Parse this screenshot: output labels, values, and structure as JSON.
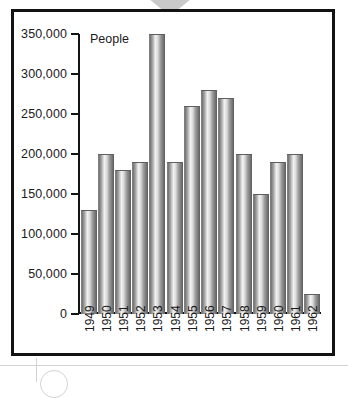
{
  "figure": {
    "axis_title": "People",
    "frame_color": "#131313",
    "bar_color": "#9d9d9d"
  },
  "chart_data": {
    "type": "bar",
    "title": "",
    "subtitle": "",
    "xlabel": "",
    "ylabel": "People",
    "ylim": [
      0,
      350000
    ],
    "grid": false,
    "legend": null,
    "categories": [
      "1949",
      "1950",
      "1951",
      "1952",
      "1953",
      "1954",
      "1955",
      "1956",
      "1957",
      "1958",
      "1959",
      "1960",
      "1961",
      "1962"
    ],
    "values": [
      130000,
      200000,
      180000,
      190000,
      350000,
      190000,
      260000,
      280000,
      270000,
      200000,
      150000,
      190000,
      200000,
      25000
    ],
    "ytick_labels": [
      "350,000",
      "300,000",
      "250,000",
      "200,000",
      "150,000",
      "100,000",
      "50,000",
      "0"
    ],
    "ytick_values": [
      350000,
      300000,
      250000,
      200000,
      150000,
      100000,
      50000,
      0
    ]
  }
}
